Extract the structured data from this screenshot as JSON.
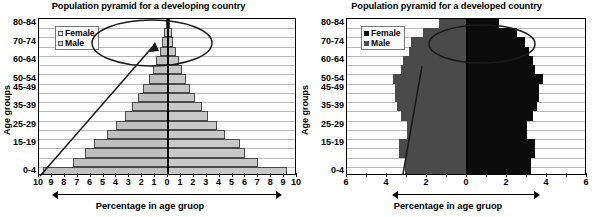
{
  "charts": [
    {
      "id": "developing",
      "title": "Population pyramid for a developing country",
      "ylabel": "Age groups",
      "xlabel": "Percentage in age gruop",
      "legend": [
        {
          "label": "Female",
          "swatch": "open-square-light"
        },
        {
          "label": "Male",
          "swatch": "open-square-light"
        }
      ],
      "age_labels": [
        "80-84",
        "70-74",
        "60-64",
        "50-54",
        "45-49",
        "35-39",
        "25-29",
        "15-19",
        "0-4"
      ],
      "xticks_left": [
        "10",
        "9",
        "8",
        "7",
        "6",
        "5",
        "4",
        "3",
        "2",
        "1",
        "0"
      ],
      "xticks_right": [
        "1",
        "2",
        "3",
        "4",
        "5",
        "6",
        "7",
        "8",
        "9",
        "10"
      ]
    },
    {
      "id": "developed",
      "title": "Population pyramid for a developed country",
      "ylabel": "Age groups",
      "xlabel": "Percentage in age gruop",
      "legend": [
        {
          "label": "Female",
          "swatch": "solid-square-black"
        },
        {
          "label": "Male",
          "swatch": "solid-square-gray"
        }
      ],
      "age_labels": [
        "80-84",
        "70-74",
        "60-64",
        "50-54",
        "45-49",
        "35-39",
        "25-29",
        "15-19",
        "0-4"
      ],
      "xticks_left": [
        "6",
        "4",
        "2",
        "0"
      ],
      "xticks_right": [
        "2",
        "4",
        "6"
      ]
    }
  ],
  "chart_data": [
    {
      "type": "bar",
      "orientation": "population-pyramid",
      "title": "Population pyramid for a developing country",
      "xlabel": "Percentage in age gruop",
      "ylabel": "Age groups",
      "xlim": [
        -10,
        10
      ],
      "xtick_values": [
        -10,
        -9,
        -8,
        -7,
        -6,
        -5,
        -4,
        -3,
        -2,
        -1,
        0,
        1,
        2,
        3,
        4,
        5,
        6,
        7,
        8,
        9,
        10
      ],
      "xtick_labels": [
        "10",
        "9",
        "8",
        "7",
        "6",
        "5",
        "4",
        "3",
        "2",
        "1",
        "0",
        "1",
        "2",
        "3",
        "4",
        "5",
        "6",
        "7",
        "8",
        "9",
        "10"
      ],
      "grid": true,
      "legend_position": "upper-left",
      "note": "Male plotted to the left of zero, Female to the right. Values are percentage of total population.",
      "categories": [
        "0-4",
        "5-9",
        "10-14",
        "15-19",
        "20-24",
        "25-29",
        "30-34",
        "35-39",
        "40-44",
        "45-49",
        "50-54",
        "55-59",
        "60-64",
        "65-69",
        "70-74",
        "75-79",
        "80-84"
      ],
      "series": [
        {
          "name": "Male",
          "side": "left",
          "values": [
            9.7,
            7.4,
            6.4,
            5.7,
            4.7,
            4.0,
            3.3,
            2.8,
            2.3,
            1.9,
            1.5,
            1.2,
            0.9,
            0.6,
            0.45,
            0.3,
            0.18
          ]
        },
        {
          "name": "Female",
          "side": "right",
          "values": [
            9.2,
            7.0,
            6.0,
            5.6,
            4.4,
            3.8,
            3.1,
            2.6,
            2.1,
            1.7,
            1.4,
            1.1,
            0.85,
            0.6,
            0.4,
            0.28,
            0.15
          ]
        }
      ]
    },
    {
      "type": "bar",
      "orientation": "population-pyramid",
      "title": "Population pyramid for a developed country",
      "xlabel": "Percentage in age gruop",
      "ylabel": "Age groups",
      "xlim": [
        -6,
        6
      ],
      "xtick_values": [
        -6,
        -4,
        -2,
        0,
        2,
        4,
        6
      ],
      "xtick_labels": [
        "6",
        "4",
        "2",
        "0",
        "2",
        "4",
        "6"
      ],
      "grid": true,
      "legend_position": "upper-left",
      "note": "Male plotted to the left of zero (dark grey), Female to the right (black).",
      "categories": [
        "0-4",
        "5-9",
        "10-14",
        "15-19",
        "20-24",
        "25-29",
        "30-34",
        "35-39",
        "40-44",
        "45-49",
        "50-54",
        "55-59",
        "60-64",
        "65-69",
        "70-74",
        "75-79",
        "80-84"
      ],
      "series": [
        {
          "name": "Male",
          "side": "left",
          "values": [
            3.1,
            3.1,
            3.4,
            3.4,
            3.0,
            3.0,
            3.3,
            3.5,
            3.6,
            3.6,
            3.7,
            3.3,
            3.2,
            2.9,
            2.8,
            2.2,
            1.4
          ]
        },
        {
          "name": "Female",
          "side": "right",
          "values": [
            3.2,
            3.2,
            3.4,
            3.4,
            3.0,
            3.0,
            3.3,
            3.5,
            3.6,
            3.6,
            3.8,
            3.4,
            3.3,
            3.1,
            2.9,
            2.5,
            1.6
          ]
        }
      ]
    }
  ]
}
